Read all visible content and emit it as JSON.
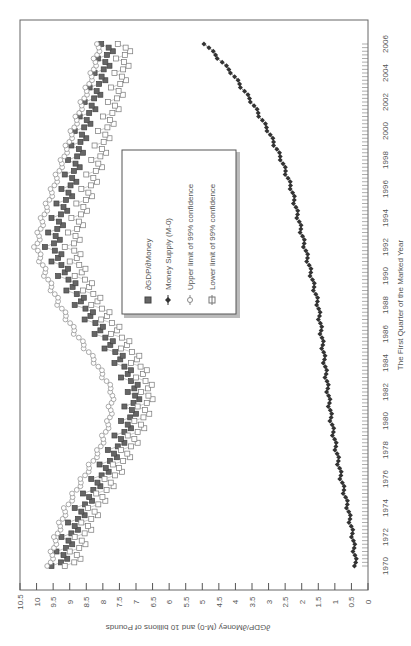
{
  "chart_data": {
    "type": "line",
    "orientation": "rotated-90-clockwise",
    "title": "",
    "xlabel": "The First Quarter of the Marked Year",
    "ylabel": "∂GDP/∂Money (M-0) and 10 billions of Pounds",
    "ylim": [
      0,
      10.5
    ],
    "xlim": [
      1970,
      2006
    ],
    "x_ticks": [
      "1970",
      "1972",
      "1974",
      "1976",
      "1978",
      "1980",
      "1982",
      "1984",
      "1986",
      "1988",
      "1990",
      "1992",
      "1994",
      "1996",
      "1998",
      "2000",
      "2002",
      "2004",
      "2006"
    ],
    "y_ticks": [
      "0",
      "0.5",
      "1",
      "1.5",
      "2",
      "2.5",
      "3",
      "3.5",
      "4",
      "4.5",
      "5",
      "5.5",
      "6",
      "6.5",
      "7",
      "7.5",
      "8",
      "8.5",
      "9",
      "9.5",
      "10",
      "10.5"
    ],
    "grid": false,
    "legend_position": "center-inside",
    "x": [
      1970,
      1972,
      1974,
      1976,
      1978,
      1980,
      1982,
      1984,
      1986,
      1988,
      1990,
      1992,
      1994,
      1996,
      1998,
      2000,
      2002,
      2004,
      2006
    ],
    "series": [
      {
        "name": "∂GDP/∂Money",
        "marker": "filled-square",
        "values": [
          9.3,
          9.0,
          8.6,
          8.1,
          7.6,
          7.2,
          7.0,
          7.4,
          8.0,
          8.6,
          9.1,
          9.5,
          9.3,
          9.0,
          8.8,
          8.6,
          8.3,
          8.0,
          7.8
        ]
      },
      {
        "name": "Money Supply (M-0)",
        "marker": "filled-diamond",
        "values": [
          0.36,
          0.45,
          0.6,
          0.8,
          0.95,
          1.1,
          1.2,
          1.3,
          1.4,
          1.5,
          1.7,
          1.9,
          2.1,
          2.3,
          2.6,
          3.0,
          3.5,
          4.1,
          4.9
        ]
      },
      {
        "name": "Upper limit of 99% confidence",
        "marker": "open-circle",
        "values": [
          9.6,
          9.4,
          9.1,
          8.6,
          8.1,
          7.8,
          7.7,
          8.2,
          8.8,
          9.3,
          9.7,
          10.0,
          9.8,
          9.5,
          9.2,
          8.9,
          8.6,
          8.3,
          8.1
        ]
      },
      {
        "name": "Lower limit of 99% confidence",
        "marker": "open-square",
        "values": [
          8.9,
          8.6,
          8.2,
          7.7,
          7.2,
          6.8,
          6.6,
          6.9,
          7.5,
          8.1,
          8.6,
          8.9,
          8.7,
          8.4,
          8.1,
          7.9,
          7.6,
          7.4,
          7.3
        ]
      }
    ]
  },
  "legend": {
    "items": [
      {
        "label": "∂GDP/∂Money"
      },
      {
        "label": "Money Supply (M-0)"
      },
      {
        "label": "Upper limit of 99% confidence"
      },
      {
        "label": "Lower limit of 99% confidence"
      }
    ]
  }
}
